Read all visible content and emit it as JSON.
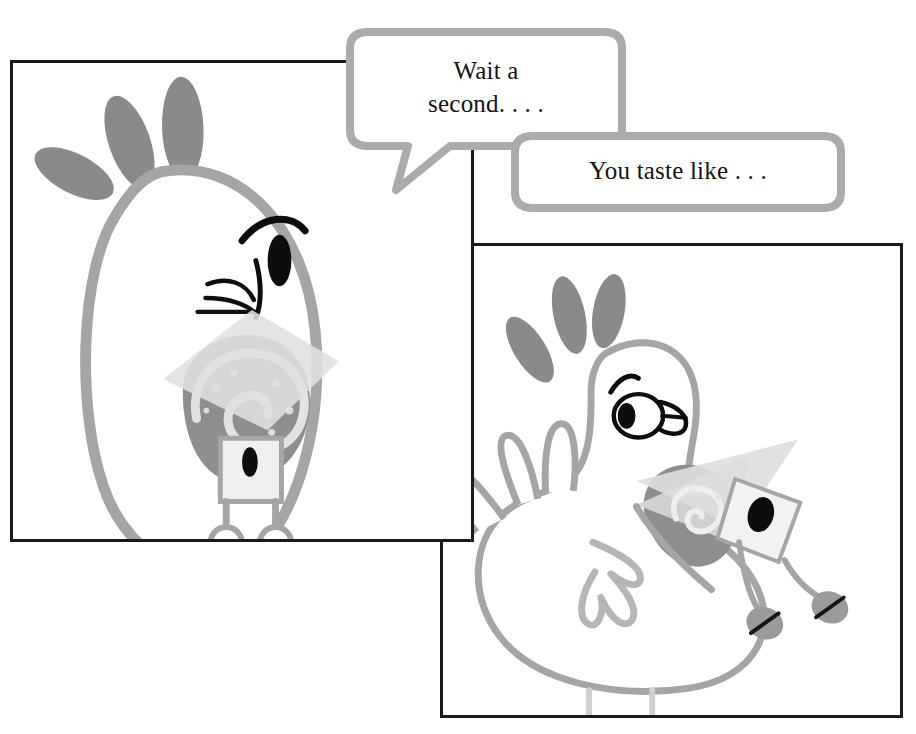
{
  "comic": {
    "title": "Chicken and snail comic strip",
    "background_color": "#ffffff",
    "panel_border_color": "#1a1a1a",
    "bubble_outline_color": "#a8a8a8",
    "bubble_fill_color": "#ffffff",
    "text_color": "#121212",
    "ink_gray": "#9a9a9a",
    "dark_gray": "#848484",
    "mid_gray": "#b3b3b3",
    "light_gray": "#d9d9d9",
    "pale_gray": "#e8e8e8",
    "black": "#000000"
  },
  "panels": [
    {
      "name": "panel-left",
      "caption": "Close-up of chicken head holding a snail in its beak",
      "x": 10,
      "y": 60,
      "width": 464,
      "height": 482
    },
    {
      "name": "panel-right",
      "caption": "Full chicken standing with the snail in its beak",
      "x": 440,
      "y": 243,
      "width": 463,
      "height": 475
    }
  ],
  "bubbles": [
    {
      "name": "speech-bubble-1",
      "text": "Wait a\nsecond. . . .",
      "tail": "down-left",
      "x": 332,
      "y": 26,
      "width": 308,
      "height": 170
    },
    {
      "name": "speech-bubble-2",
      "text": "You taste like . . .",
      "tail": "left",
      "x": 507,
      "y": 130,
      "width": 342,
      "height": 86
    }
  ]
}
